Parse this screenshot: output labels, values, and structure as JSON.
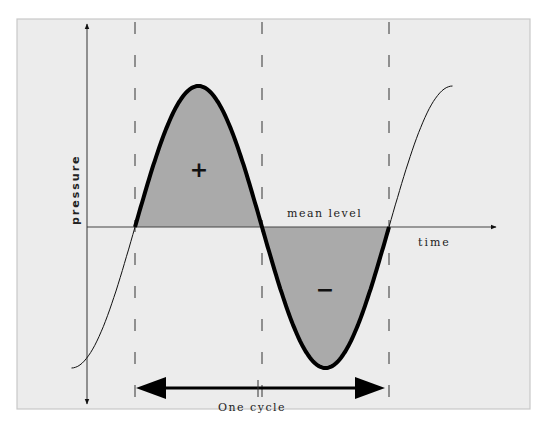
{
  "figure": {
    "type": "waveform-diagram",
    "axes": {
      "y_label": "pressure",
      "x_label": "time"
    },
    "labels": {
      "mean_level": "mean level",
      "positive_sign": "+",
      "negative_sign": "−",
      "cycle": "One cycle"
    },
    "wave": {
      "function": "sine",
      "cycles_shaded": 1,
      "shaded_positive_half": true,
      "shaded_negative_half": true,
      "visible_start_phase_deg": -90,
      "visible_end_phase_deg": 450
    },
    "dashed_markers": [
      "cycle-start",
      "half-cycle",
      "cycle-end"
    ],
    "colors": {
      "panel_bg": "#ececec",
      "panel_border": "#c8c8c8",
      "fill": "#aaaaaa",
      "ink": "#111111"
    }
  }
}
